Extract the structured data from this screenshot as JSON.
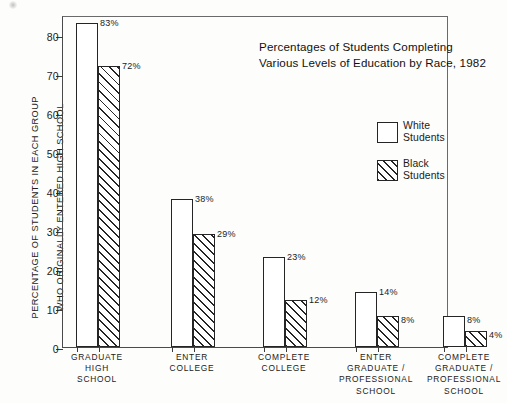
{
  "chart_data": {
    "type": "bar",
    "title": "Percentages of Students Completing Various Levels of Education by Race, 1982",
    "title_lines": [
      "Percentages of Students Completing",
      "Various Levels of Education by Race, 1982"
    ],
    "xlabel": "",
    "ylabel": "PERCENTAGE OF STUDENTS IN EACH GROUP WHO ORIGINALLY ENTERED HIGH SCHOOL",
    "ylabel_lines": [
      "PERCENTAGE OF STUDENTS IN EACH GROUP",
      "WHO ORIGINALLY ENTERED HIGH SCHOOL"
    ],
    "categories": [
      "GRADUATE HIGH SCHOOL",
      "ENTER COLLEGE",
      "COMPLETE COLLEGE",
      "ENTER GRADUATE / PROFESSIONAL SCHOOL",
      "COMPLETE GRADUATE / PROFESSIONAL SCHOOL"
    ],
    "category_label_lines": [
      [
        "GRADUATE",
        "HIGH",
        "SCHOOL"
      ],
      [
        "ENTER",
        "COLLEGE"
      ],
      [
        "COMPLETE",
        "COLLEGE"
      ],
      [
        "ENTER",
        "GRADUATE /",
        "PROFESSIONAL",
        "SCHOOL"
      ],
      [
        "COMPLETE",
        "GRADUATE /",
        "PROFESSIONAL",
        "SCHOOL"
      ]
    ],
    "series": [
      {
        "name": "White Students",
        "values": [
          83,
          38,
          23,
          14,
          8
        ],
        "labels": [
          "83%",
          "38%",
          "23%",
          "14%",
          "8%"
        ],
        "fill": "white",
        "color": "#ffffff",
        "edge_color": "#252525"
      },
      {
        "name": "Black Students",
        "values": [
          72,
          29,
          12,
          8,
          4
        ],
        "labels": [
          "72%",
          "29%",
          "12%",
          "8%",
          "4%"
        ],
        "fill": "diagonal-hatch",
        "color": "#ffffff",
        "edge_color": "#252525"
      }
    ],
    "ylim": [
      0,
      85
    ],
    "yticks": [
      0,
      10,
      20,
      30,
      40,
      50,
      60,
      70,
      80
    ],
    "ytick_labels": [
      "0",
      "10",
      "20",
      "30",
      "40",
      "50",
      "60",
      "70",
      "80"
    ],
    "grid": false,
    "legend_position": "center right",
    "value_label_unit": "%"
  },
  "legend": {
    "entries": [
      {
        "label": "White Students",
        "lines": [
          "White",
          "Students"
        ],
        "swatch": "empty-box"
      },
      {
        "label": "Black Students",
        "lines": [
          "Black",
          "Students"
        ],
        "swatch": "hatched-box"
      }
    ]
  },
  "colors": {
    "background": "#fdfdfb",
    "ink": "#1b1b1b",
    "bar_edge": "#252525",
    "frame": "#4a4a4a"
  }
}
